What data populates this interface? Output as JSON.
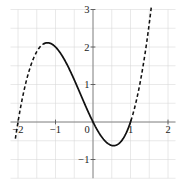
{
  "chart_data": {
    "type": "line",
    "title": "",
    "xlabel": "",
    "ylabel": "",
    "function": "f(x) = x^3 + x^2 - 2x = x(x-1)(x+2)",
    "coefficients_desc_order": [
      1,
      1,
      -2,
      0
    ],
    "xlim": [
      -2.2,
      2.2
    ],
    "ylim": [
      -1.5,
      3.0
    ],
    "grid": true,
    "grid_step": 0.5,
    "x_plot_domain": [
      -2.07,
      1.56
    ],
    "solid_segment": [
      -1.3,
      1.01
    ],
    "dashed_segments": [
      [
        -2.07,
        -1.3
      ],
      [
        1.01,
        1.56
      ]
    ],
    "x_tick_labels": [
      {
        "value": -2,
        "label": "−2"
      },
      {
        "value": -1,
        "label": "−1"
      },
      {
        "value": 0,
        "label": "0"
      },
      {
        "value": 1,
        "label": "1"
      },
      {
        "value": 2,
        "label": "2"
      }
    ],
    "y_tick_labels": [
      {
        "value": 3,
        "label": "3"
      },
      {
        "value": 2,
        "label": "2"
      },
      {
        "value": 1,
        "label": "1"
      },
      {
        "value": -1,
        "label": "−1"
      }
    ],
    "key_points": {
      "x_intercepts": [
        [
          -2,
          0
        ],
        [
          0,
          0
        ],
        [
          1,
          0
        ]
      ],
      "y_intercept": [
        0,
        0
      ],
      "local_max": [
        -1.215,
        2.113
      ],
      "local_min": [
        0.549,
        -0.631
      ]
    },
    "sample_points": [
      [
        -2,
        0
      ],
      [
        -1.5,
        1.875
      ],
      [
        -1,
        2
      ],
      [
        -0.5,
        1.125
      ],
      [
        0,
        0
      ],
      [
        0.5,
        -0.625
      ],
      [
        1,
        0
      ],
      [
        1.5,
        2.625
      ]
    ],
    "style": {
      "curve_color": "#111111",
      "axis_color": "#7a7a7a",
      "tick_color": "#555555",
      "grid_color": "#d6d6d6",
      "label_color": "#222222",
      "background": "#ffffff",
      "dash_pattern": "3.6 2.6"
    }
  }
}
